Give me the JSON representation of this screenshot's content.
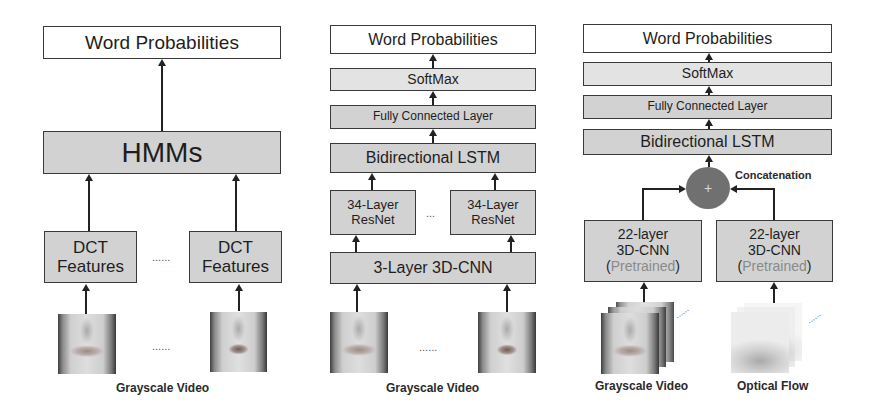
{
  "panels": [
    {
      "name": "hmm-pipeline",
      "output": "Word Probabilities",
      "model": "HMMs",
      "features": {
        "line1": "DCT",
        "line2": "Features"
      },
      "ellipsis": "......",
      "input_label": "Grayscale Video"
    },
    {
      "name": "resnet-lstm-pipeline",
      "output": "Word Probabilities",
      "softmax": "SoftMax",
      "fc": "Fully Connected Layer",
      "lstm": "Bidirectional LSTM",
      "resnet": {
        "line1": "34-Layer",
        "line2": "ResNet"
      },
      "resnet_ellipsis": "...",
      "frontend": "3-Layer 3D-CNN",
      "ellipsis": "......",
      "input_label": "Grayscale Video"
    },
    {
      "name": "two-stream-pipeline",
      "output": "Word Probabilities",
      "softmax": "SoftMax",
      "fc": "Fully Connected Layer",
      "lstm": "Bidirectional LSTM",
      "merge_symbol": "+",
      "merge_label": "Concatenation",
      "cnn": {
        "line1": "22-layer",
        "line2": "3D-CNN",
        "open": "(",
        "pretrained": "Pretrained",
        "close": ")"
      },
      "stack_ellipsis": "......",
      "input_labels": [
        "Grayscale Video",
        "Optical Flow"
      ]
    }
  ],
  "colors": {
    "box_border": "#3a3a3a",
    "box_light": "#e3e3e3",
    "box_mid": "#d2d2d2",
    "merge_circle": "#707070",
    "pretrained_text": "#8a8a8a"
  }
}
